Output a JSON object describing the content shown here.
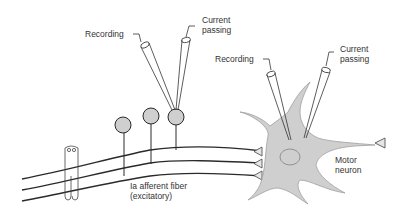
{
  "labels": {
    "left_recording": "Recording",
    "left_current_1": "Current",
    "left_current_2": "passing",
    "right_recording": "Recording",
    "right_current_1": "Current",
    "right_current_2": "passing",
    "fiber_1": "Ia afferent fiber",
    "fiber_2": "(excitatory)",
    "motor_1": "Motor",
    "motor_2": "neuron"
  },
  "colors": {
    "line": "#2a2a2a",
    "fill_gray": "#cfcfcf",
    "soma_outline": "#9a9a9a"
  }
}
